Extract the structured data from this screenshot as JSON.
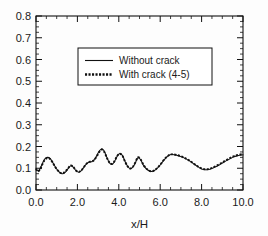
{
  "chart_data": {
    "type": "line",
    "title": "",
    "xlabel": "x/H",
    "ylabel": "",
    "xlim": [
      0.0,
      10.0
    ],
    "ylim": [
      0.0,
      0.8
    ],
    "grid": false,
    "legend_position": "upper-center",
    "x_ticks": [
      "0.0",
      "2.0",
      "4.0",
      "6.0",
      "8.0",
      "10.0"
    ],
    "x_tick_values": [
      0.0,
      2.0,
      4.0,
      6.0,
      8.0,
      10.0
    ],
    "x_minor_interval": 0.5,
    "y_ticks": [
      "0.0",
      "0.1",
      "0.2",
      "0.3",
      "0.4",
      "0.5",
      "0.6",
      "0.7",
      "0.8"
    ],
    "y_tick_values": [
      0.0,
      0.1,
      0.2,
      0.3,
      0.4,
      0.5,
      0.6,
      0.7,
      0.8
    ],
    "y_minor_interval": 0.025,
    "series": [
      {
        "name": "Without crack",
        "style": "solid",
        "color": "#111111",
        "x": [
          0.0,
          0.08,
          0.18,
          0.3,
          0.42,
          0.55,
          0.68,
          0.8,
          0.92,
          1.05,
          1.18,
          1.3,
          1.42,
          1.55,
          1.68,
          1.8,
          1.92,
          2.05,
          2.18,
          2.3,
          2.42,
          2.55,
          2.68,
          2.8,
          2.92,
          3.05,
          3.18,
          3.3,
          3.42,
          3.55,
          3.68,
          3.8,
          3.92,
          4.05,
          4.18,
          4.3,
          4.42,
          4.55,
          4.68,
          4.8,
          4.92,
          5.05,
          5.2,
          5.4,
          5.6,
          5.8,
          6.0,
          6.2,
          6.4,
          6.55,
          6.8,
          7.1,
          7.4,
          7.7,
          8.0,
          8.3,
          8.6,
          8.9,
          9.2,
          9.5,
          9.75,
          10.0
        ],
        "y": [
          0.1,
          0.088,
          0.095,
          0.12,
          0.142,
          0.15,
          0.145,
          0.128,
          0.108,
          0.09,
          0.078,
          0.075,
          0.082,
          0.098,
          0.112,
          0.105,
          0.09,
          0.082,
          0.088,
          0.103,
          0.118,
          0.128,
          0.13,
          0.138,
          0.155,
          0.178,
          0.19,
          0.178,
          0.15,
          0.125,
          0.118,
          0.132,
          0.155,
          0.168,
          0.158,
          0.132,
          0.11,
          0.098,
          0.105,
          0.125,
          0.148,
          0.14,
          0.112,
          0.092,
          0.085,
          0.095,
          0.115,
          0.14,
          0.158,
          0.163,
          0.16,
          0.15,
          0.135,
          0.115,
          0.097,
          0.093,
          0.103,
          0.118,
          0.135,
          0.15,
          0.158,
          0.162
        ]
      },
      {
        "name": "With crack  (4-5)",
        "style": "dotted",
        "color": "#111111",
        "x": [
          0.0,
          0.08,
          0.18,
          0.3,
          0.42,
          0.55,
          0.68,
          0.8,
          0.92,
          1.05,
          1.18,
          1.3,
          1.42,
          1.55,
          1.68,
          1.8,
          1.92,
          2.05,
          2.18,
          2.3,
          2.42,
          2.55,
          2.68,
          2.8,
          2.92,
          3.05,
          3.18,
          3.3,
          3.42,
          3.55,
          3.68,
          3.8,
          3.92,
          4.05,
          4.18,
          4.3,
          4.42,
          4.55,
          4.68,
          4.8,
          4.92,
          5.05,
          5.2,
          5.4,
          5.6,
          5.8,
          6.0,
          6.2,
          6.4,
          6.55,
          6.8,
          7.1,
          7.4,
          7.7,
          8.0,
          8.3,
          8.6,
          8.9,
          9.2,
          9.5,
          9.75,
          10.0
        ],
        "y": [
          0.098,
          0.086,
          0.092,
          0.116,
          0.138,
          0.147,
          0.143,
          0.127,
          0.107,
          0.09,
          0.079,
          0.077,
          0.085,
          0.1,
          0.113,
          0.106,
          0.091,
          0.083,
          0.089,
          0.104,
          0.119,
          0.129,
          0.131,
          0.137,
          0.152,
          0.174,
          0.186,
          0.175,
          0.149,
          0.126,
          0.12,
          0.134,
          0.156,
          0.167,
          0.156,
          0.131,
          0.11,
          0.099,
          0.107,
          0.127,
          0.15,
          0.142,
          0.114,
          0.093,
          0.086,
          0.096,
          0.116,
          0.141,
          0.159,
          0.164,
          0.161,
          0.151,
          0.136,
          0.116,
          0.099,
          0.096,
          0.106,
          0.121,
          0.138,
          0.153,
          0.161,
          0.165
        ]
      }
    ],
    "legend_entries": [
      {
        "label": "Without crack",
        "style": "solid"
      },
      {
        "label": "With crack  (4-5)",
        "style": "dotted"
      }
    ]
  }
}
